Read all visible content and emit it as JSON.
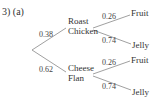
{
  "question": {
    "label": "3) (a)"
  },
  "tree": {
    "first": [
      {
        "name_line1": "Roast",
        "name_line2": "Chicken",
        "prob": "0.38"
      },
      {
        "name_line1": "Cheese",
        "name_line2": "Flan",
        "prob": "0.62"
      }
    ],
    "second": [
      {
        "parent": "Roast Chicken",
        "outcome": "Fruit",
        "prob": "0.26"
      },
      {
        "parent": "Roast Chicken",
        "outcome": "Jelly",
        "prob": "0.74"
      },
      {
        "parent": "Cheese Flan",
        "outcome": "Fruit",
        "prob": "0.26"
      },
      {
        "parent": "Cheese Flan",
        "outcome": "Jelly",
        "prob": "0.74"
      }
    ]
  },
  "colors": {
    "line": "#777777",
    "text": "#333333"
  }
}
